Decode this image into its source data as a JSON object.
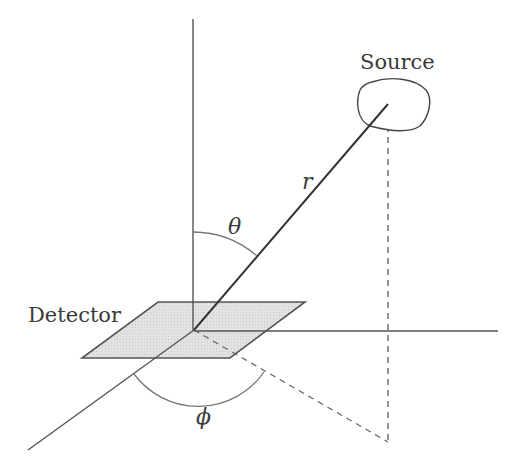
{
  "labels": {
    "source": "Source",
    "detector": "Detector",
    "r": "r",
    "theta": "θ",
    "phi": "ϕ"
  },
  "colors": {
    "axis": "#555555",
    "ray": "#333333",
    "dashed": "#666666",
    "arc": "#777777",
    "detector_fill": "#dcdcdc",
    "detector_stroke": "#555555",
    "text": "#3a3a3a"
  },
  "geometry": {
    "origin": [
      194,
      330
    ],
    "source_point": [
      388,
      104
    ],
    "projection_point": [
      388,
      442
    ]
  }
}
